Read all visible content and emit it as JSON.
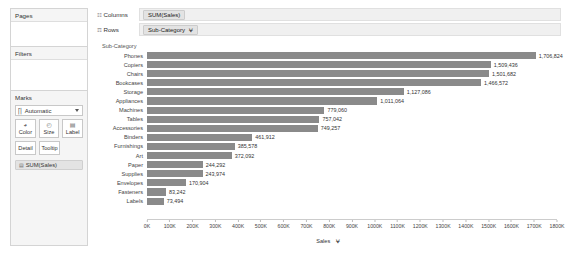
{
  "sidebar": {
    "pages": {
      "title": "Pages"
    },
    "filters": {
      "title": "Filters"
    },
    "marks": {
      "title": "Marks",
      "type_icon": "bar-chart-icon",
      "type_label": "Automatic",
      "buttons": [
        {
          "name": "color",
          "label": "Color",
          "glyph": "◕"
        },
        {
          "name": "size",
          "label": "Size",
          "glyph": "◴"
        },
        {
          "name": "label",
          "label": "Label",
          "glyph": "▤"
        }
      ],
      "secondary_buttons": [
        {
          "name": "detail",
          "label": "Detail"
        },
        {
          "name": "tooltip",
          "label": "Tooltip"
        }
      ],
      "pill": {
        "icon": "▤",
        "label": "SUM(Sales)"
      }
    }
  },
  "shelves": {
    "columns": {
      "label": "Columns",
      "icon": "☷",
      "pill": "SUM(Sales)",
      "sort": ""
    },
    "rows": {
      "label": "Rows",
      "icon": "☶",
      "pill": "Sub-Category",
      "sort": "⩝"
    }
  },
  "chart_data": {
    "type": "bar",
    "title": "",
    "row_header_title": "Sub-Category",
    "orientation": "horizontal",
    "xlabel": "Sales",
    "ylabel": "Sub-Category",
    "xlim": [
      0,
      1800000
    ],
    "grid": false,
    "legend": "none",
    "tick_labels": [
      "0K",
      "100K",
      "200K",
      "300K",
      "400K",
      "500K",
      "600K",
      "700K",
      "800K",
      "900K",
      "1000K",
      "1100K",
      "1200K",
      "1300K",
      "1400K",
      "1500K",
      "1600K",
      "1700K",
      "1800K"
    ],
    "tick_values": [
      0,
      100000,
      200000,
      300000,
      400000,
      500000,
      600000,
      700000,
      800000,
      900000,
      1000000,
      1100000,
      1200000,
      1300000,
      1400000,
      1500000,
      1600000,
      1700000,
      1800000
    ],
    "bar_color": "#8a8a8a",
    "categories": [
      "Phones",
      "Copiers",
      "Chairs",
      "Bookcases",
      "Storage",
      "Appliances",
      "Machines",
      "Tables",
      "Accessories",
      "Binders",
      "Furnishings",
      "Art",
      "Paper",
      "Supplies",
      "Envelopes",
      "Fasteners",
      "Labels"
    ],
    "values": [
      1706824,
      1509436,
      1501682,
      1466572,
      1127086,
      1011064,
      779060,
      757042,
      749257,
      461912,
      385578,
      372092,
      244292,
      243974,
      170904,
      83242,
      73494
    ],
    "value_labels": [
      "1,706,824",
      "1,509,436",
      "1,501,682",
      "1,466,572",
      "1,127,086",
      "1,011,064",
      "779,060",
      "757,042",
      "749,257",
      "461,912",
      "385,578",
      "372,092",
      "244,292",
      "243,974",
      "170,904",
      "83,242",
      "73,494"
    ]
  }
}
